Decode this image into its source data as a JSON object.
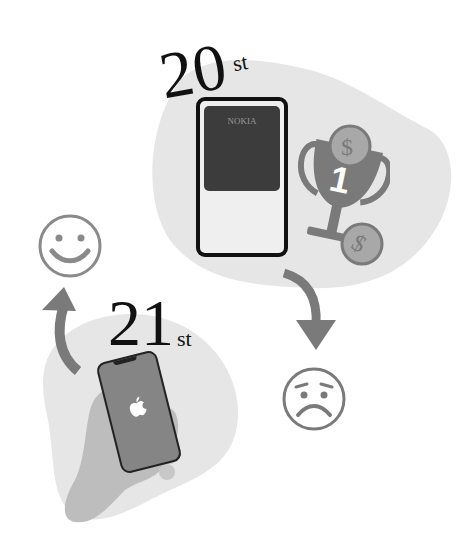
{
  "top": {
    "century_number": "20",
    "century_suffix": "st",
    "phone_brand": "NOKIA",
    "trophy_rank": "1",
    "coin_symbol": "$"
  },
  "bottom": {
    "century_number": "21",
    "century_suffix": "st"
  },
  "colors": {
    "blob": "#e6e6e6",
    "icon_gray": "#7a7a7a",
    "coin_gray": "#a8a8a8",
    "phone_screen_dark": "#3c3c3c",
    "iphone_body": "#858585",
    "hand": "#bdbdbd",
    "text": "#111111"
  }
}
